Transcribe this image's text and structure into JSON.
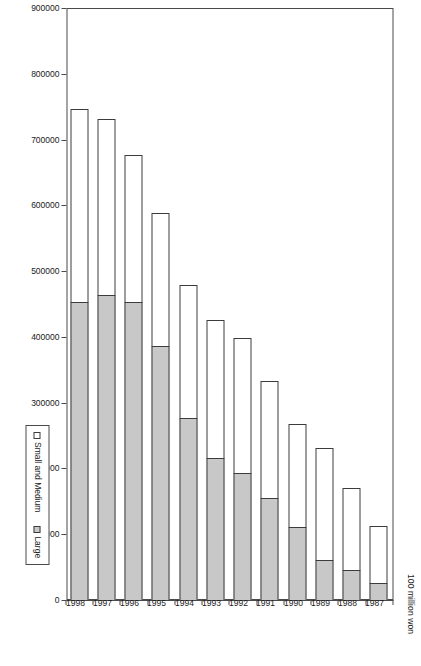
{
  "chart_data": {
    "type": "bar",
    "orientation": "horizontal-stacked",
    "title": "",
    "subtitle": "",
    "xlabel": "100 million won",
    "ylabel": "",
    "axis_unit_label": "100 million won",
    "grid": false,
    "legend_position": "bottom-right",
    "categories": [
      "1987",
      "1988",
      "1989",
      "1990",
      "1991",
      "1992",
      "1993",
      "1994",
      "1995",
      "1996",
      "1997",
      "1998"
    ],
    "xlim": [
      0,
      900000
    ],
    "xticks": [
      0,
      100000,
      200000,
      300000,
      400000,
      500000,
      600000,
      700000,
      800000,
      900000
    ],
    "xtick_labels": [
      "0",
      "100000",
      "200000",
      "300000",
      "400000",
      "500000",
      "600000",
      "700000",
      "800000",
      "900000"
    ],
    "series": [
      {
        "name": "Large",
        "color": "#c8c8c8",
        "values": [
          27500,
          47000,
          63000,
          113000,
          157000,
          195000,
          217000,
          278000,
          388000,
          454000,
          465000,
          454000
        ]
      },
      {
        "name": "Small and Medium",
        "color": "#ffffff",
        "values": [
          88000,
          127000,
          171000,
          157000,
          179000,
          206000,
          212000,
          204000,
          204000,
          226000,
          270000,
          295000
        ]
      }
    ],
    "totals": [
      115500,
      174000,
      234000,
      270000,
      336000,
      401000,
      429000,
      482000,
      592000,
      680000,
      735000,
      749000
    ],
    "legend": [
      "Small and Medium",
      "Large"
    ]
  },
  "legend": {
    "items": [
      {
        "label": "Small and Medium",
        "swatch": "sm"
      },
      {
        "label": "Large",
        "swatch": "large"
      }
    ]
  }
}
